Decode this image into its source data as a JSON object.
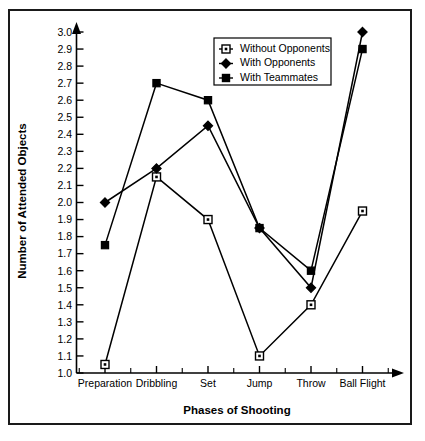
{
  "chart_data": {
    "type": "line",
    "title": "",
    "xlabel": "Phases of Shooting",
    "ylabel": "Number of Attended Objects",
    "categories": [
      "Preparation",
      "Dribbling",
      "Set",
      "Jump",
      "Throw",
      "Ball Flight"
    ],
    "ylim": [
      1.0,
      3.0
    ],
    "ytick_step": 0.1,
    "yticks": [
      "1.0",
      "1.1",
      "1.2",
      "1.3",
      "1.4",
      "1.5",
      "1.6",
      "1.7",
      "1.8",
      "1.9",
      "2.0",
      "2.1",
      "2.2",
      "2.3",
      "2.4",
      "2.5",
      "2.6",
      "2.7",
      "2.8",
      "2.9",
      "3.0"
    ],
    "grid": false,
    "legend_position": "top-right",
    "series": [
      {
        "name": "Without Opponents",
        "marker": "open-square",
        "values": [
          1.05,
          2.15,
          1.9,
          1.1,
          1.4,
          1.95
        ]
      },
      {
        "name": "With Opponents",
        "marker": "filled-diamond",
        "values": [
          2.0,
          2.2,
          2.45,
          1.85,
          1.5,
          3.0
        ]
      },
      {
        "name": "With Teammates",
        "marker": "filled-square",
        "values": [
          1.75,
          2.7,
          2.6,
          1.85,
          1.6,
          2.9
        ]
      }
    ]
  },
  "axes": {
    "y_title": "Number of Attended Objects",
    "x_title": "Phases of Shooting"
  },
  "legend": {
    "entries": [
      {
        "label": "Without Opponents",
        "marker": "open-square-icon"
      },
      {
        "label": "With Opponents",
        "marker": "filled-diamond-icon"
      },
      {
        "label": "With Teammates",
        "marker": "filled-square-icon"
      }
    ]
  }
}
